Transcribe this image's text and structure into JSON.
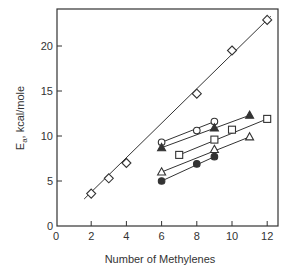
{
  "chart_data": {
    "type": "scatter",
    "title": "",
    "xlabel": "Number of Methylenes",
    "ylabel": "E",
    "ylabel_sub": "a",
    "ylabel_units": ", kcal/mole",
    "xlim": [
      0,
      12.6
    ],
    "ylim": [
      0,
      24
    ],
    "xticks": [
      0,
      2,
      4,
      6,
      8,
      10,
      12
    ],
    "yticks": [
      0,
      5,
      10,
      15,
      20
    ],
    "grid": false,
    "legend": null,
    "series": [
      {
        "name": "open-diamond",
        "marker": "diamond",
        "filled": false,
        "x": [
          2,
          3,
          4,
          8,
          10,
          12
        ],
        "y": [
          3.6,
          5.3,
          7.0,
          14.7,
          19.5,
          22.9
        ],
        "fit_line": [
          [
            1.6,
            3.0
          ],
          [
            12.2,
            23.3
          ]
        ]
      },
      {
        "name": "open-circle",
        "marker": "circle",
        "filled": false,
        "x": [
          6,
          8,
          9
        ],
        "y": [
          9.3,
          10.6,
          11.6
        ],
        "fit_line": [
          [
            6,
            9.3
          ],
          [
            9,
            11.6
          ]
        ]
      },
      {
        "name": "filled-triangle",
        "marker": "triangle",
        "filled": true,
        "x": [
          6,
          9,
          11
        ],
        "y": [
          8.7,
          10.9,
          12.3
        ],
        "fit_line": [
          [
            6,
            8.7
          ],
          [
            11,
            12.3
          ]
        ]
      },
      {
        "name": "open-square",
        "marker": "square",
        "filled": false,
        "x": [
          7,
          9,
          10,
          12
        ],
        "y": [
          7.9,
          9.6,
          10.7,
          11.9
        ],
        "fit_line": [
          [
            7,
            7.9
          ],
          [
            12,
            11.9
          ]
        ]
      },
      {
        "name": "open-triangle",
        "marker": "triangle",
        "filled": false,
        "x": [
          6,
          9,
          11
        ],
        "y": [
          6.0,
          8.5,
          9.9
        ],
        "fit_line": [
          [
            6,
            6.0
          ],
          [
            11,
            9.9
          ]
        ]
      },
      {
        "name": "filled-circle",
        "marker": "circle",
        "filled": true,
        "x": [
          6,
          8,
          9
        ],
        "y": [
          5.0,
          6.9,
          7.7
        ],
        "fit_line": [
          [
            6,
            5.0
          ],
          [
            9,
            7.7
          ]
        ]
      }
    ]
  },
  "layout": {
    "plot_left": 57,
    "plot_top": 9,
    "plot_right": 278,
    "plot_bottom": 226,
    "x0_px": 56,
    "px_per_x": 17.6,
    "y0_px": 226,
    "px_per_y": 9.0,
    "stroke_color": "#333333"
  }
}
